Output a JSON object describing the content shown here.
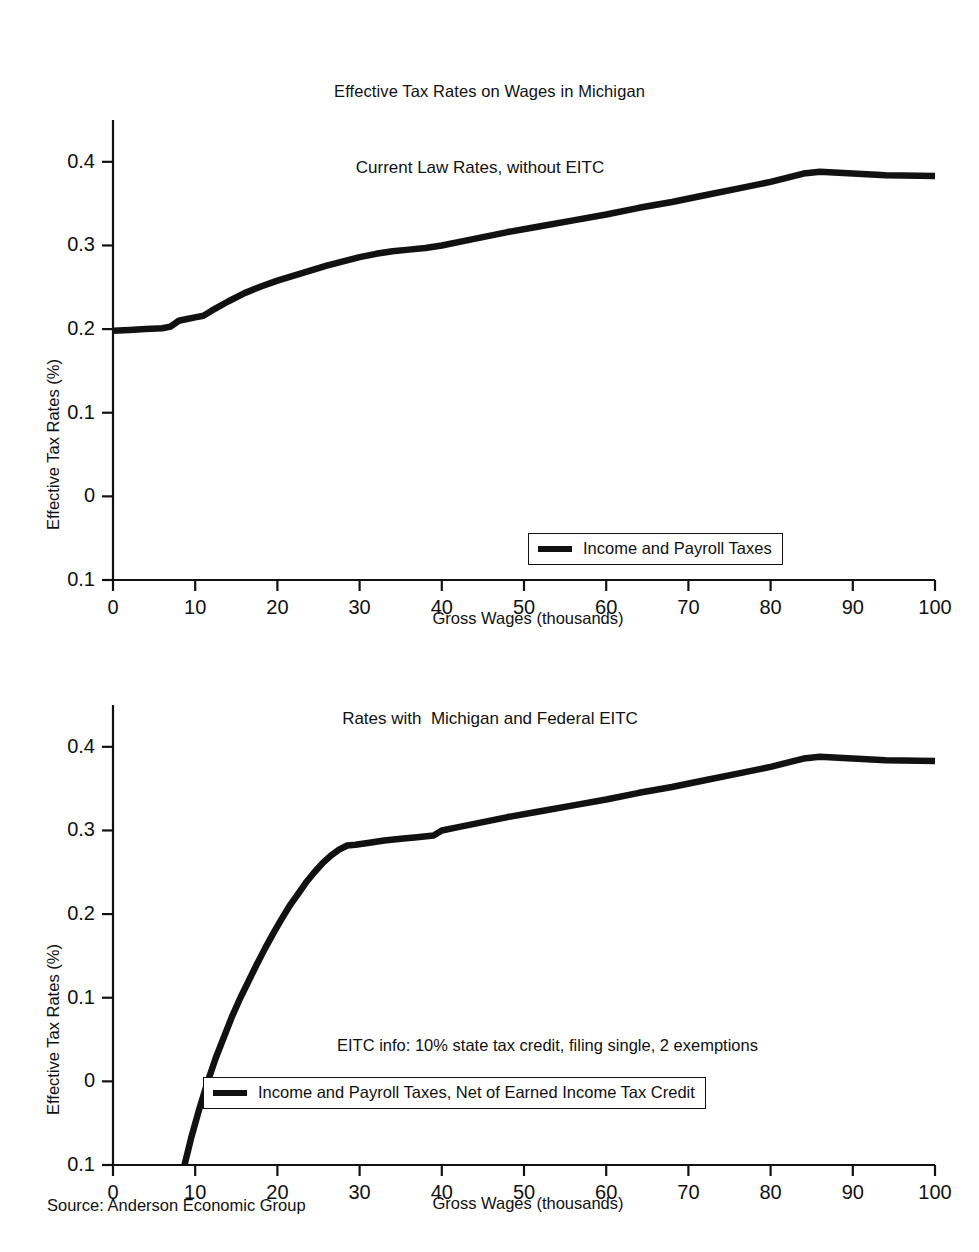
{
  "figure": {
    "title": "Effective Tax Rates on Wages in Michigan",
    "source": "Source: Anderson Economic Group"
  },
  "chart_data": [
    {
      "type": "line",
      "title": "Current Law Rates, without EITC",
      "xlabel": "Gross Wages (thousands)",
      "ylabel": "Effective Tax Rates (%)",
      "xlim": [
        0,
        100
      ],
      "ylim": [
        -0.1,
        0.45
      ],
      "xticks": [
        0,
        10,
        20,
        30,
        40,
        50,
        60,
        70,
        80,
        90,
        100
      ],
      "xticklabels": [
        "0",
        "10",
        "20",
        "30",
        "40",
        "50",
        "60",
        "70",
        "80",
        "90",
        "100"
      ],
      "yticks": [
        0.4,
        0.3,
        0.2,
        0.1,
        0,
        -0.1
      ],
      "yticklabels": [
        "0.4",
        "0.3",
        "0.2",
        "0.1",
        "0",
        "0.1"
      ],
      "grid": false,
      "legend_position": "lower right",
      "series": [
        {
          "name": "Income and Payroll Taxes",
          "color": "#111111",
          "x": [
            0,
            2,
            4,
            6,
            7,
            8,
            9,
            10,
            11,
            12,
            14,
            16,
            18,
            20,
            22,
            24,
            26,
            28,
            30,
            32,
            34,
            36,
            38,
            40,
            42,
            45,
            48,
            52,
            56,
            60,
            64,
            68,
            72,
            76,
            80,
            84,
            86,
            90,
            94,
            100
          ],
          "y": [
            0.198,
            0.199,
            0.2,
            0.201,
            0.203,
            0.21,
            0.212,
            0.214,
            0.216,
            0.222,
            0.233,
            0.243,
            0.251,
            0.258,
            0.264,
            0.27,
            0.276,
            0.281,
            0.286,
            0.29,
            0.293,
            0.295,
            0.297,
            0.3,
            0.304,
            0.31,
            0.316,
            0.323,
            0.33,
            0.337,
            0.345,
            0.352,
            0.36,
            0.368,
            0.376,
            0.386,
            0.388,
            0.386,
            0.384,
            0.383
          ]
        }
      ]
    },
    {
      "type": "line",
      "title": "Rates with  Michigan and Federal EITC",
      "xlabel": "Gross Wages (thousands)",
      "ylabel": "Effective Tax Rates (%)",
      "xlim": [
        0,
        100
      ],
      "ylim": [
        -0.1,
        0.45
      ],
      "xticks": [
        0,
        10,
        20,
        30,
        40,
        50,
        60,
        70,
        80,
        90,
        100
      ],
      "xticklabels": [
        "0",
        "10",
        "20",
        "30",
        "40",
        "50",
        "60",
        "70",
        "80",
        "90",
        "100"
      ],
      "yticks": [
        0.4,
        0.3,
        0.2,
        0.1,
        0,
        -0.1
      ],
      "yticklabels": [
        "0.4",
        "0.3",
        "0.2",
        "0.1",
        "0",
        "0.1"
      ],
      "grid": false,
      "legend_position": "lower right",
      "annotation": "EITC info: 10% state tax credit, filing single, 2 exemptions",
      "series": [
        {
          "name": "Income and Payroll Taxes, Net of Earned Income Tax Credit",
          "color": "#111111",
          "x": [
            8.7,
            9.5,
            10.5,
            11.5,
            12.5,
            13.5,
            14.5,
            15.5,
            16.5,
            17.5,
            18.5,
            19.5,
            20.5,
            21.5,
            22.5,
            23.5,
            24.5,
            25.5,
            26.5,
            27.5,
            28.5,
            29.5,
            31,
            33,
            35,
            37,
            39,
            40,
            42,
            45,
            48,
            52,
            56,
            60,
            64,
            68,
            72,
            76,
            80,
            84,
            86,
            90,
            94,
            100
          ],
          "y": [
            -0.1,
            -0.068,
            -0.033,
            -0.001,
            0.028,
            0.053,
            0.078,
            0.1,
            0.12,
            0.14,
            0.159,
            0.177,
            0.194,
            0.21,
            0.224,
            0.238,
            0.25,
            0.261,
            0.27,
            0.277,
            0.282,
            0.283,
            0.285,
            0.288,
            0.29,
            0.292,
            0.294,
            0.3,
            0.304,
            0.31,
            0.316,
            0.323,
            0.33,
            0.337,
            0.345,
            0.352,
            0.36,
            0.368,
            0.376,
            0.386,
            0.388,
            0.386,
            0.384,
            0.383
          ]
        }
      ]
    }
  ],
  "panels": {
    "top": {
      "subtitle": "Current Law Rates, without EITC",
      "y_axis_title": "Effective Tax Rates (%)",
      "x_axis_title": "Gross Wages (thousands)",
      "legend_label": "Income and Payroll Taxes"
    },
    "bottom": {
      "subtitle": "Rates with  Michigan and Federal EITC",
      "y_axis_title": "Effective Tax Rates (%)",
      "x_axis_title": "Gross Wages (thousands)",
      "legend_label": "Income and Payroll Taxes, Net of Earned Income Tax Credit",
      "annotation": "EITC info: 10% state tax credit, filing single, 2 exemptions"
    }
  },
  "colors": {
    "line": "#111111",
    "axis": "#111111",
    "background": "#ffffff"
  }
}
